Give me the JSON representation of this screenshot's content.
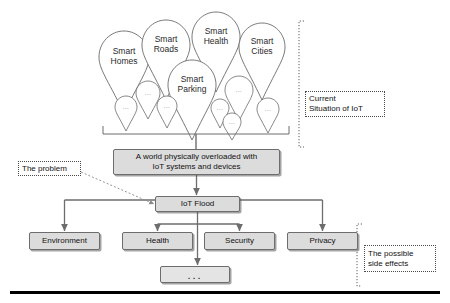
{
  "diagram": {
    "colors": {
      "box_fill": "#dcdcdc",
      "box_stroke": "#6d6d6d",
      "pin_stroke": "#6a6a6a",
      "connector": "#6d6d6d",
      "note_stroke": "#4a4a4a",
      "baseline": "#000000"
    },
    "ellipsis": "...",
    "pins_large": [
      {
        "label": "Smart\nHomes",
        "cx": 124,
        "cy": 57,
        "rx": 25,
        "ry": 26,
        "tip_y": 113
      },
      {
        "label": "Smart\nRoads",
        "cx": 166,
        "cy": 45,
        "rx": 24,
        "ry": 25,
        "tip_y": 100
      },
      {
        "label": "Smart\nHealth",
        "cx": 216,
        "cy": 37,
        "rx": 24,
        "ry": 25,
        "tip_y": 92
      },
      {
        "label": "Smart\nCities",
        "cx": 262,
        "cy": 47,
        "rx": 23,
        "ry": 24,
        "tip_y": 100
      },
      {
        "label": "Smart\nParking",
        "cx": 192,
        "cy": 85,
        "rx": 24,
        "ry": 25,
        "tip_y": 140
      }
    ],
    "pins_small": [
      {
        "cx": 148,
        "cy": 93,
        "rx": 12,
        "ry": 12,
        "tip_y": 119
      },
      {
        "cx": 126,
        "cy": 107,
        "rx": 11,
        "ry": 11,
        "tip_y": 131
      },
      {
        "cx": 167,
        "cy": 106,
        "rx": 10,
        "ry": 10,
        "tip_y": 128
      },
      {
        "cx": 239,
        "cy": 90,
        "rx": 14,
        "ry": 14,
        "tip_y": 121
      },
      {
        "cx": 220,
        "cy": 108,
        "rx": 9,
        "ry": 9,
        "tip_y": 128
      },
      {
        "cx": 232,
        "cy": 122,
        "rx": 9,
        "ry": 9,
        "tip_y": 140
      },
      {
        "cx": 268,
        "cy": 109,
        "rx": 11,
        "ry": 11,
        "tip_y": 133
      }
    ],
    "bracket": {
      "left_x": 103,
      "right_x": 289,
      "y": 134,
      "tick": 8,
      "stem_to_y": 149
    },
    "boxes": [
      {
        "id": "world-overload",
        "label": "A world physically overloaded with\nIoT systems and devices",
        "x": 113,
        "y": 149,
        "w": 167,
        "h": 26
      },
      {
        "id": "iot-flood",
        "label": "IoT Flood",
        "x": 155,
        "y": 196,
        "w": 85,
        "h": 16
      },
      {
        "id": "environment",
        "label": "Environment",
        "x": 29,
        "y": 232,
        "w": 71,
        "h": 18
      },
      {
        "id": "health",
        "label": "Health",
        "x": 122,
        "y": 232,
        "w": 71,
        "h": 18
      },
      {
        "id": "security",
        "label": "Security",
        "x": 204,
        "y": 232,
        "w": 71,
        "h": 18
      },
      {
        "id": "privacy",
        "label": "Privacy",
        "x": 287,
        "y": 232,
        "w": 71,
        "h": 18
      },
      {
        "id": "more-effects",
        "label": "...",
        "x": 160,
        "y": 266,
        "w": 70,
        "h": 17
      }
    ],
    "notes": [
      {
        "id": "current-situation",
        "label": "Current\nSituation of IoT",
        "x": 305,
        "y": 91,
        "w": 80,
        "h": 26
      },
      {
        "id": "the-problem",
        "label": "The problem",
        "x": 18,
        "y": 161,
        "w": 63,
        "h": 15
      },
      {
        "id": "side-effects",
        "label": "The possible\nside effects",
        "x": 364,
        "y": 245,
        "w": 72,
        "h": 27
      }
    ],
    "note_brackets": [
      {
        "id": "current-situation-bracket",
        "x": 299,
        "y1": 21,
        "y2": 147,
        "tick": 5
      },
      {
        "id": "side-effects-bracket",
        "x": 357,
        "y1": 224,
        "y2": 286,
        "tick": 5
      }
    ],
    "leader": {
      "id": "problem-leader",
      "from_x": 81,
      "from_y": 172,
      "to_x": 154,
      "to_y": 204
    },
    "baseline": {
      "x": 10,
      "y": 291,
      "w": 430,
      "h": 2.5
    }
  }
}
